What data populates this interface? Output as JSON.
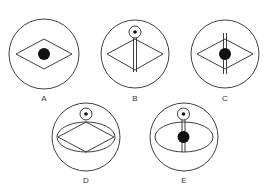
{
  "figures": [
    {
      "id": "A",
      "label": "A",
      "description": "circle with diamond and central black dot"
    },
    {
      "id": "B",
      "label": "B",
      "description": "circle with diamond, small ringed dot at top, twin vertical lines through diamond"
    },
    {
      "id": "C",
      "label": "C",
      "description": "circle with diamond, twin vertical lines and central black dot"
    },
    {
      "id": "D",
      "label": "D",
      "description": "circle with ellipse enclosing diamond, small ringed dot at top"
    },
    {
      "id": "E",
      "label": "E",
      "description": "circle with ellipse, small ringed dot at top, twin vertical lines and central black dot"
    }
  ],
  "colors": {
    "line": "#2a2a2a",
    "dot": "#111111",
    "background": "#ffffff"
  }
}
